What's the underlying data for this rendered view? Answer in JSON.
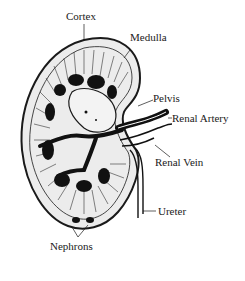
{
  "diagram": {
    "labels": {
      "cortex": "Cortex",
      "medulla": "Medulla",
      "pelvis": "Pelvis",
      "renal_artery": "Renal Artery",
      "renal_vein": "Renal Vein",
      "ureter": "Ureter",
      "nephrons": "Nephrons"
    },
    "colors": {
      "ink": "#1a1a1a",
      "background": "#ffffff",
      "fill": "#e9e9e9"
    }
  }
}
